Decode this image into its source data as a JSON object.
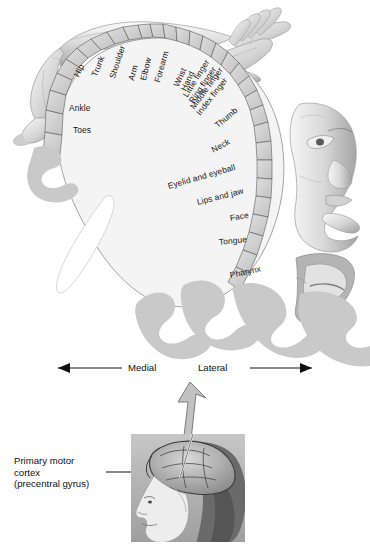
{
  "figure": {
    "type": "anatomical-diagram"
  },
  "cortex_map": {
    "band_labels": [
      {
        "text": "Hip",
        "x": 76,
        "y": 72,
        "rot": -62
      },
      {
        "text": "Trunk",
        "x": 94,
        "y": 72,
        "rot": -68
      },
      {
        "text": "Shoulder",
        "x": 112,
        "y": 74,
        "rot": -72
      },
      {
        "text": "Arm",
        "x": 131,
        "y": 76,
        "rot": -74
      },
      {
        "text": "Elbow",
        "x": 143,
        "y": 76,
        "rot": -76
      },
      {
        "text": "Forearm",
        "x": 157,
        "y": 78,
        "rot": -74
      },
      {
        "text": "Wrist",
        "x": 176,
        "y": 82,
        "rot": -66
      },
      {
        "text": "Hand",
        "x": 183,
        "y": 86,
        "rot": -64
      },
      {
        "text": "Little finger",
        "x": 185,
        "y": 92,
        "rot": -58
      },
      {
        "text": "Ring finger",
        "x": 191,
        "y": 98,
        "rot": -56
      },
      {
        "text": "Middle finger",
        "x": 192,
        "y": 104,
        "rot": -54
      },
      {
        "text": "Index finger",
        "x": 198,
        "y": 110,
        "rot": -52
      },
      {
        "text": "Thumb",
        "x": 216,
        "y": 122,
        "rot": -40
      },
      {
        "text": "Neck",
        "x": 212,
        "y": 146,
        "rot": -28
      },
      {
        "text": "Eyelid and eyeball",
        "x": 168,
        "y": 182,
        "rot": -16
      },
      {
        "text": "Lips and jaw",
        "x": 197,
        "y": 198,
        "rot": -14
      },
      {
        "text": "Face",
        "x": 230,
        "y": 214,
        "rot": -10
      },
      {
        "text": "Tongue",
        "x": 219,
        "y": 238,
        "rot": -6
      },
      {
        "text": "Pharynx",
        "x": 230,
        "y": 271,
        "rot": -12
      },
      {
        "text": "Ankle",
        "x": 69,
        "y": 104,
        "rot": 0
      },
      {
        "text": "Toes",
        "x": 73,
        "y": 126,
        "rot": 0
      }
    ]
  },
  "orientation": {
    "medial_label": "Medial",
    "lateral_label": "Lateral",
    "medial_arrow": "left-arrow",
    "lateral_arrow": "right-arrow"
  },
  "callout": {
    "text": "Primary motor\ncortex\n(precentral gyrus)",
    "leader_line": "leader-line",
    "pointer_arrow": "up-arrow"
  },
  "inset": {
    "name": "head-profile-photo",
    "description": "Lateral view of a human head with brain overlay"
  },
  "colors": {
    "cortex_fill": "#f2f2f2",
    "band_fill": "#d2d2d2",
    "gyrus_gray": "#c9c9c9",
    "outline": "#5a5a5a",
    "text": "#141414",
    "inset_bg": "#b9b9b9"
  }
}
